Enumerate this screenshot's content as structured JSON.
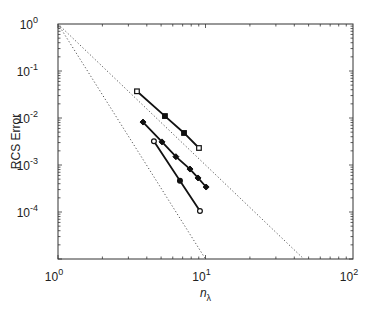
{
  "chart_data": {
    "type": "line",
    "title": "",
    "xlabel": "n_λ",
    "xlabel_main": "n",
    "xlabel_sub": "λ",
    "ylabel": "RCS Error",
    "xscale": "log",
    "yscale": "log",
    "xlim": [
      1,
      100
    ],
    "ylim": [
      1e-05,
      1
    ],
    "grid": false,
    "legend": null,
    "x_ticks": [
      {
        "base": "10",
        "exp": "0",
        "value": 1
      },
      {
        "base": "10",
        "exp": "1",
        "value": 10
      },
      {
        "base": "10",
        "exp": "2",
        "value": 100
      }
    ],
    "y_ticks": [
      {
        "base": "10",
        "exp": "0",
        "value": 1
      },
      {
        "base": "10",
        "exp": "-1",
        "value": 0.1
      },
      {
        "base": "10",
        "exp": "-2",
        "value": 0.01
      },
      {
        "base": "10",
        "exp": "-3",
        "value": 0.001
      },
      {
        "base": "10",
        "exp": "-4",
        "value": 0.0001
      }
    ],
    "series": [
      {
        "name": "squares",
        "marker": "square",
        "x": [
          3.43,
          5.31,
          7.15,
          9.03
        ],
        "y": [
          0.037,
          0.011,
          0.0048,
          0.0023
        ]
      },
      {
        "name": "diamonds",
        "marker": "diamond",
        "x": [
          3.77,
          5.07,
          6.3,
          7.85,
          8.9,
          10.1
        ],
        "y": [
          0.0082,
          0.0031,
          0.0015,
          0.00082,
          0.00053,
          0.00034
        ]
      },
      {
        "name": "circles",
        "marker": "circle",
        "x": [
          4.47,
          6.71,
          9.17
        ],
        "y": [
          0.0032,
          0.00046,
          0.000105
        ]
      }
    ],
    "reference_lines": [
      {
        "name": "slope -3",
        "style": "dotted",
        "x": [
          1,
          46.4
        ],
        "y": [
          1,
          1e-05
        ]
      },
      {
        "name": "slope -5",
        "style": "dotted",
        "x": [
          1,
          10
        ],
        "y": [
          1,
          1e-05
        ]
      }
    ]
  }
}
